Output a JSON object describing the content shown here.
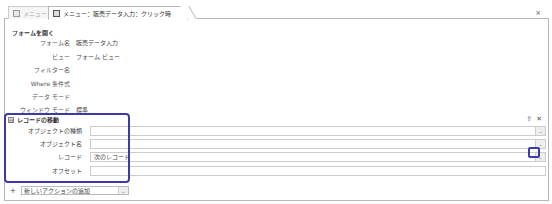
{
  "tabs": [
    {
      "label": "メニュー",
      "active": false
    },
    {
      "label": "メニュー：販売データ入力：クリック時",
      "active": true
    }
  ],
  "close_icon": "×",
  "open_form": {
    "title": "フォームを開く",
    "rows": [
      {
        "label": "フォーム名",
        "value": "販売データ入力"
      },
      {
        "label": "ビュー",
        "value": "フォーム ビュー"
      },
      {
        "label": "フィルター名",
        "value": ""
      },
      {
        "label": "Where 条件式",
        "value": ""
      },
      {
        "label": "データ モード",
        "value": ""
      },
      {
        "label": "ウィンドウ モード",
        "value": "標準"
      }
    ]
  },
  "goto_record": {
    "collapse_icon": "⊟",
    "title": "レコードの移動",
    "up_icon": "⇧",
    "delete_icon": "✕",
    "fields": [
      {
        "label": "オブジェクトの種類",
        "value": "",
        "dropdown": true
      },
      {
        "label": "オブジェクト名",
        "value": "",
        "dropdown": true
      },
      {
        "label": "レコード",
        "value": "次のレコード",
        "dropdown": true
      },
      {
        "label": "オフセット",
        "value": "",
        "dropdown": false
      }
    ]
  },
  "add_action": {
    "plus_icon": "+",
    "label": "新しいアクションの追加",
    "dropdown_icon": "⌄"
  },
  "highlight_color": "#3b3aa8"
}
